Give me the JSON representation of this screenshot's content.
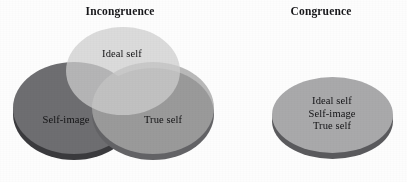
{
  "figure": {
    "type": "venn-diagram-comparison",
    "background_color": "#ffffff"
  },
  "panels": [
    {
      "id": "incongruence",
      "title": "Incongruence",
      "circles": [
        {
          "id": "ideal-self",
          "label": "Ideal self",
          "position": "top",
          "color": "#cecece"
        },
        {
          "id": "self-image",
          "label": "Self-image",
          "position": "left",
          "color": "#6e6e71"
        },
        {
          "id": "true-self",
          "label": "True self",
          "position": "right",
          "color": "#a8a8a8"
        }
      ]
    },
    {
      "id": "congruence",
      "title": "Congruence",
      "circles": [
        {
          "id": "all-aligned",
          "color": "#a9a9ab",
          "labels": [
            "Ideal self",
            "Self-image",
            "True self"
          ]
        }
      ]
    }
  ],
  "labels": {
    "ideal_self": "Ideal self",
    "self_image": "Self-image",
    "true_self": "True self"
  },
  "colors": {
    "ideal_self": "#cecece",
    "self_image": "#6e6e71",
    "true_self": "#a8a8a8",
    "congruence_disc": "#a9a9ab",
    "rim_shadow": "#4b4b4f",
    "text": "#17171a",
    "background": "#ffffff"
  }
}
